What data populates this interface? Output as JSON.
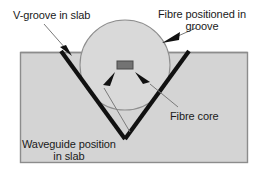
{
  "figure": {
    "labels": {
      "v_groove": "V-groove in slab",
      "fibre_positioned_line1": "Fibre positioned in",
      "fibre_positioned_line2": "groove",
      "fibre_core": "Fibre core",
      "waveguide_line1": "Waveguide position",
      "waveguide_line2": "in slab"
    },
    "colors": {
      "background": "#ffffff",
      "slab_fill": "#d4d4d4",
      "slab_stroke": "#8c8c8c",
      "fibre_fill": "#d9d9d9",
      "fibre_stroke": "#8c8c8c",
      "core_fill": "#737373",
      "core_stroke": "#4d4d4d",
      "groove_line": "#111111",
      "leader_line": "#7a7a7a",
      "text": "#1a1a1a"
    },
    "geometry": {
      "slab": {
        "x": 20,
        "y": 52,
        "width": 228,
        "height": 111
      },
      "fibre_circle": {
        "cx": 125,
        "cy": 65,
        "r": 45
      },
      "core_rect": {
        "x": 117,
        "y": 61,
        "width": 16,
        "height": 8
      },
      "v_groove": {
        "left_top_x": 61,
        "right_top_x": 189,
        "top_y": 52,
        "vertex_x": 125,
        "vertex_y": 139
      }
    }
  }
}
